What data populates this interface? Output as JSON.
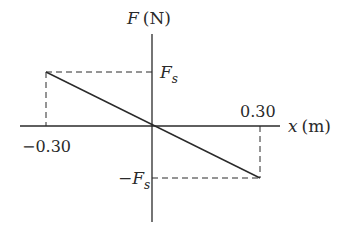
{
  "diagram": {
    "type": "force-displacement graph",
    "y_axis": {
      "symbol": "F",
      "unit": "(N)"
    },
    "x_axis": {
      "symbol": "x",
      "unit": "(m)"
    },
    "x_ticks": {
      "left": "−0.30",
      "right": "0.30"
    },
    "y_ticks": {
      "top_symbol": "F",
      "top_sub": "s",
      "bottom_prefix": "−",
      "bottom_symbol": "F",
      "bottom_sub": "s"
    },
    "line": {
      "from": {
        "x": -0.3,
        "F": "Fs"
      },
      "to": {
        "x": 0.3,
        "F": "-Fs"
      }
    },
    "colors": {
      "ink": "#2a2a2a",
      "background": "#ffffff"
    }
  }
}
